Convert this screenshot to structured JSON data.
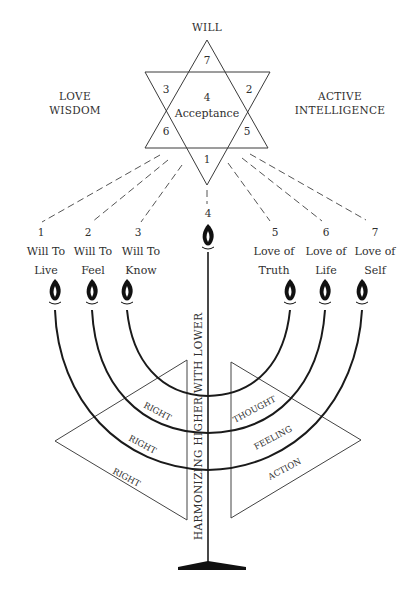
{
  "star": {
    "top_label": "WILL",
    "left_label_line1": "LOVE",
    "left_label_line2": "WISDOM",
    "right_label_line1": "ACTIVE",
    "right_label_line2": "INTELLIGENCE",
    "regions": {
      "top": "7",
      "upper_left": "3",
      "upper_right": "2",
      "center_number": "4",
      "center_text": "Acceptance",
      "lower_left": "6",
      "lower_right": "5",
      "bottom": "1"
    }
  },
  "branches": [
    {
      "number": "1",
      "line1": "Will To",
      "line2": "Live"
    },
    {
      "number": "2",
      "line1": "Will To",
      "line2": "Feel"
    },
    {
      "number": "3",
      "line1": "Will To",
      "line2": "Know"
    },
    {
      "number": "4",
      "line1": "",
      "line2": ""
    },
    {
      "number": "5",
      "line1": "Love of",
      "line2": "Truth"
    },
    {
      "number": "6",
      "line1": "Love of",
      "line2": "Life"
    },
    {
      "number": "7",
      "line1": "Love of",
      "line2": "Self"
    }
  ],
  "stem_label": "HARMONIZING HIGHER WITH LOWER",
  "left_triangle": {
    "labels": [
      "RIGHT",
      "RIGHT",
      "RIGHT"
    ]
  },
  "right_triangle": {
    "labels": [
      "THOUGHT",
      "FEELING",
      "ACTION"
    ]
  },
  "colors": {
    "ink": "#1a1a1a",
    "text": "#2f2f2f",
    "background": "#ffffff"
  }
}
